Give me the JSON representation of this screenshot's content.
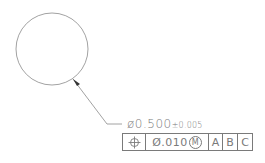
{
  "drawing": {
    "feature": {
      "shape": "circle",
      "cx": 52,
      "cy": 49,
      "r": 36
    },
    "leader": {
      "arrow_tip": [
        73,
        79
      ],
      "elbow": [
        107,
        124
      ],
      "end": [
        122,
        124
      ]
    },
    "dimension": {
      "diameter_symbol": "ø",
      "nominal": "0.500",
      "tolerance": "±0.005"
    },
    "feature_control_frame": {
      "characteristic_icon": "position-icon",
      "tolerance_prefix": "Ø",
      "tolerance_value": ".010",
      "modifier": "M",
      "datums": [
        "A",
        "B",
        "C"
      ]
    },
    "line_color": "#7a7a7a"
  }
}
